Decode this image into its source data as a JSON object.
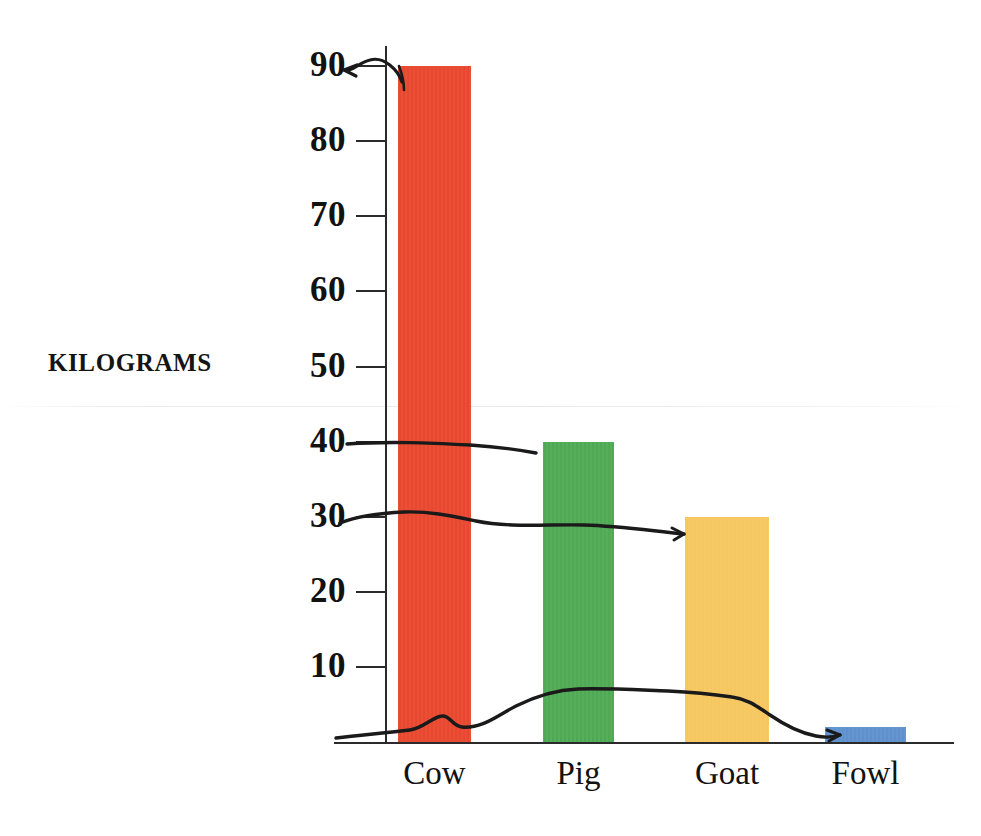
{
  "chart_data": {
    "type": "bar",
    "title": "",
    "subtitle": "",
    "xlabel": "",
    "ylabel": "KILOGRAMS",
    "categories": [
      "Cow",
      "Pig",
      "Goat",
      "Fowl"
    ],
    "values": [
      90,
      40,
      30,
      2
    ],
    "bar_colors": [
      "#E8442A",
      "#4CA851",
      "#F7C65C",
      "#5B8FCC"
    ],
    "ylim": [
      0,
      95
    ],
    "yticks": [
      10,
      20,
      30,
      40,
      50,
      60,
      70,
      80,
      90
    ],
    "ytick_labels": [
      "10",
      "20",
      "30",
      "40",
      "50",
      "60",
      "70",
      "80",
      "90"
    ],
    "grid": false,
    "legend": "none",
    "annotations": [
      {
        "name": "cow-level-line",
        "description": "hand-drawn curved arrow from top of Cow bar pointing left to the 90 tick",
        "value": 90
      },
      {
        "name": "pig-level-line",
        "description": "hand-drawn line from the 40 tick running right to the top of the Pig bar",
        "value": 40
      },
      {
        "name": "goat-level-line",
        "description": "hand-drawn line from the 30 tick running right to the top of the Goat bar",
        "value": 30
      },
      {
        "name": "fowl-level-line",
        "description": "hand-drawn wavy line along the baseline ending with an arrowhead at the Fowl bar",
        "value": 2
      }
    ]
  },
  "axis": {
    "y_title": "KILOGRAMS"
  },
  "colors": {
    "axis": "#2b2b2b",
    "text": "#121212",
    "ink": "#1a1a1a",
    "cow": "#E8442A",
    "pig": "#4CA851",
    "goat": "#F7C65C",
    "fowl": "#5B8FCC"
  }
}
